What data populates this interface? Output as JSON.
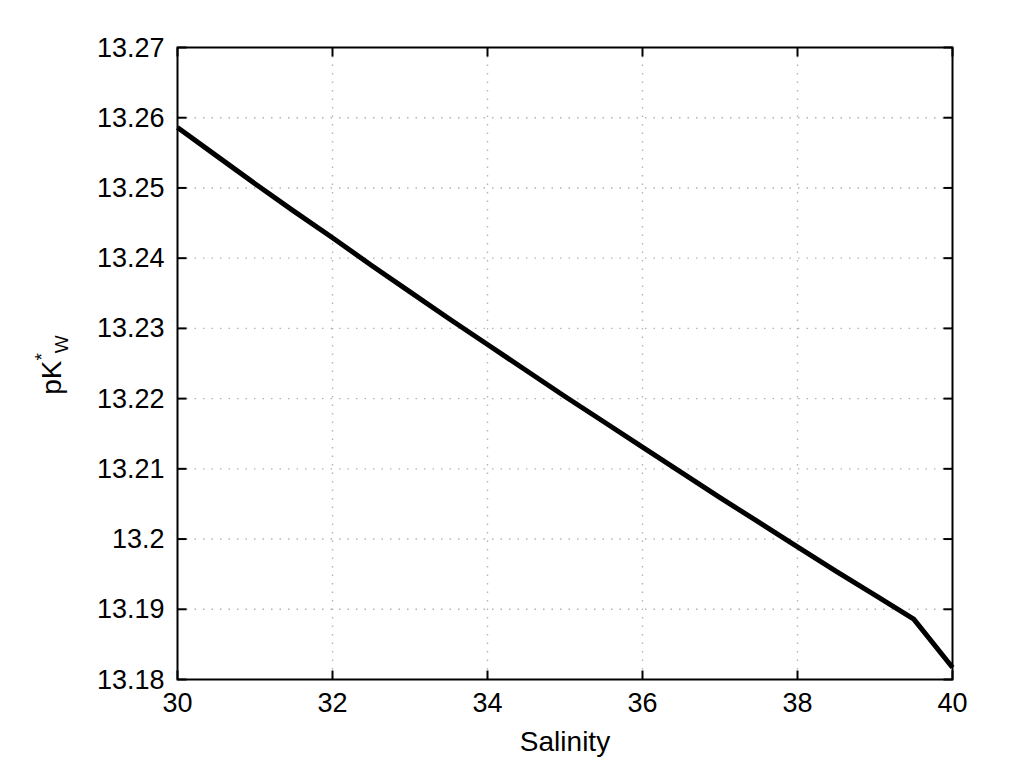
{
  "chart_data": {
    "type": "line",
    "title": "",
    "xlabel": "Salinity",
    "ylabel": "pK*W",
    "ylabel_parts": {
      "base": "pK",
      "subscript": "W",
      "superscript": "*"
    },
    "xlim": [
      30,
      40
    ],
    "ylim": [
      13.18,
      13.27
    ],
    "xticks": [
      "30",
      "32",
      "34",
      "36",
      "38",
      "40"
    ],
    "xtick_values": [
      30,
      32,
      34,
      36,
      38,
      40
    ],
    "yticks": [
      "13.18",
      "13.19",
      "13.2",
      "13.21",
      "13.22",
      "13.23",
      "13.24",
      "13.25",
      "13.26",
      "13.27"
    ],
    "ytick_values": [
      13.18,
      13.19,
      13.2,
      13.21,
      13.22,
      13.23,
      13.24,
      13.25,
      13.26,
      13.27
    ],
    "grid": true,
    "grid_style": "dotted",
    "grid_color": "#b4b4b4",
    "legend": false,
    "line_color": "#000000",
    "line_width": 5,
    "series": [
      {
        "name": "pKw*",
        "x": [
          30.0,
          30.5,
          31.0,
          31.5,
          32.0,
          32.5,
          33.0,
          33.5,
          34.0,
          34.5,
          35.0,
          35.5,
          36.0,
          36.5,
          37.0,
          37.5,
          38.0,
          38.5,
          39.0,
          39.5,
          40.0
        ],
        "y": [
          13.2586,
          13.2546,
          13.2506,
          13.2467,
          13.2429,
          13.239,
          13.2352,
          13.2314,
          13.2277,
          13.224,
          13.2203,
          13.2167,
          13.2131,
          13.2095,
          13.2059,
          13.2024,
          13.1989,
          13.1954,
          13.192,
          13.1886,
          13.1817
        ]
      }
    ]
  },
  "axes": {
    "box_color": "#000000",
    "background": "#ffffff",
    "tick_direction": "in"
  }
}
